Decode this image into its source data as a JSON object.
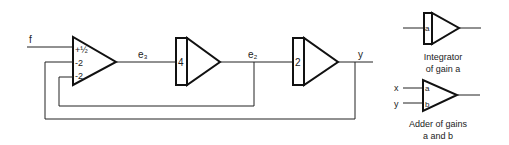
{
  "main_diagram": {
    "input_label": "f",
    "amplifier": {
      "gains": [
        "+½",
        "-2",
        "-2"
      ]
    },
    "integrator_1": {
      "gain": "4",
      "output_label": "e₂"
    },
    "signal_e3": "e₃",
    "integrator_2": {
      "gain": "2",
      "output_label": "y"
    }
  },
  "legend": {
    "integrator": {
      "gain": "a",
      "caption_line1": "Integrator",
      "caption_line2": "of gain a"
    },
    "adder": {
      "input_x": "x",
      "input_y": "y",
      "gain_a": "a",
      "gain_b": "b",
      "caption_line1": "Adder of gains",
      "caption_line2": "a and b"
    }
  }
}
